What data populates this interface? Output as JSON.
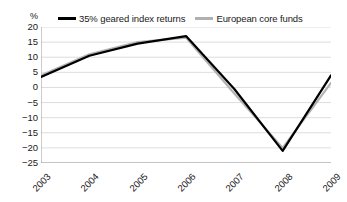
{
  "chart_data": {
    "type": "line",
    "title": "",
    "xlabel": "",
    "ylabel": "%",
    "categories": [
      "2003",
      "2004",
      "2005",
      "2006",
      "2007",
      "2008",
      "2009"
    ],
    "ylim": [
      -25,
      20
    ],
    "yticks": [
      20,
      15,
      10,
      5,
      0,
      -5,
      -10,
      -15,
      -20,
      -25
    ],
    "ytick_labels": [
      "20",
      "15",
      "10",
      "5",
      "0",
      "−5",
      "−10",
      "−15",
      "−20",
      "−25"
    ],
    "grid": true,
    "legend_position": "top",
    "series": [
      {
        "name": "35% geared index returns",
        "color": "#000000",
        "values": [
          3.5,
          10.5,
          14.5,
          17,
          -0.5,
          -21,
          4
        ]
      },
      {
        "name": "European core funds",
        "color": "#b3b3b3",
        "values": [
          4,
          11,
          15,
          16.5,
          -2,
          -20,
          1.5
        ]
      }
    ]
  },
  "axis": {
    "unit_label": "%"
  },
  "legend": {
    "entries": [
      {
        "label": "35% geared index returns",
        "swatch": "black"
      },
      {
        "label": "European core funds",
        "swatch": "gray"
      }
    ]
  }
}
